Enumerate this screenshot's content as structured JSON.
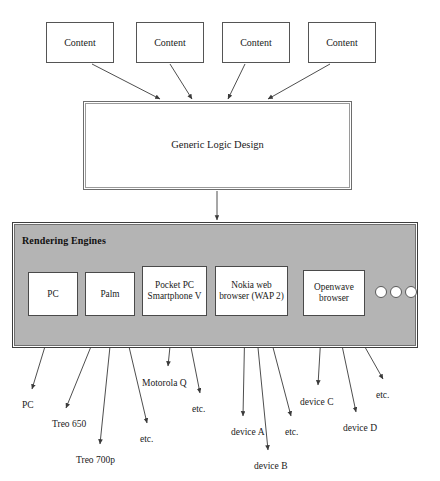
{
  "diagram": {
    "content_boxes": [
      {
        "label": "Content",
        "x": 46,
        "y": 22,
        "w": 68,
        "h": 41
      },
      {
        "label": "Content",
        "x": 136,
        "y": 22,
        "w": 68,
        "h": 41
      },
      {
        "label": "Content",
        "x": 222,
        "y": 22,
        "w": 68,
        "h": 41
      },
      {
        "label": "Content",
        "x": 308,
        "y": 22,
        "w": 68,
        "h": 41
      }
    ],
    "logic_box": {
      "label": "Generic Logic Design",
      "x": 83,
      "y": 101,
      "w": 269,
      "h": 89
    },
    "engines_panel": {
      "title": "Rendering Engines",
      "title_x": 22,
      "title_y": 235,
      "x": 12,
      "y": 222,
      "w": 406,
      "h": 126,
      "fill": "#b4b4b4"
    },
    "engine_boxes": [
      {
        "label": "PC",
        "x": 28,
        "y": 272,
        "w": 50,
        "h": 44
      },
      {
        "label": "Palm",
        "x": 85,
        "y": 272,
        "w": 50,
        "h": 44
      },
      {
        "label": "Pocket PC Smartphone V",
        "x": 142,
        "y": 266,
        "w": 65,
        "h": 50
      },
      {
        "label": "Nokia web browser (WAP 2)",
        "x": 215,
        "y": 266,
        "w": 73,
        "h": 50
      },
      {
        "label": "Openwave browser",
        "x": 303,
        "y": 270,
        "w": 62,
        "h": 46
      }
    ],
    "dots": [
      {
        "cx": 381,
        "cy": 292,
        "r": 6
      },
      {
        "cx": 396,
        "cy": 292,
        "r": 6
      },
      {
        "cx": 411,
        "cy": 292,
        "r": 6
      }
    ],
    "leaf_labels": [
      {
        "label": "PC",
        "x": 22,
        "y": 400
      },
      {
        "label": "Treo 650",
        "x": 52,
        "y": 419
      },
      {
        "label": "Treo 700p",
        "x": 76,
        "y": 455
      },
      {
        "label": "etc.",
        "x": 140,
        "y": 434
      },
      {
        "label": "Motorola Q",
        "x": 142,
        "y": 378
      },
      {
        "label": "etc.",
        "x": 192,
        "y": 404
      },
      {
        "label": "device A",
        "x": 231,
        "y": 427
      },
      {
        "label": "device B",
        "x": 254,
        "y": 461
      },
      {
        "label": "etc.",
        "x": 285,
        "y": 427
      },
      {
        "label": "device C",
        "x": 300,
        "y": 397
      },
      {
        "label": "device D",
        "x": 343,
        "y": 423
      },
      {
        "label": "etc.",
        "x": 376,
        "y": 390
      }
    ],
    "arrows": {
      "content_to_logic": [
        {
          "x1": 92,
          "y1": 64,
          "x2": 160,
          "y2": 99
        },
        {
          "x1": 170,
          "y1": 64,
          "x2": 192,
          "y2": 99
        },
        {
          "x1": 245,
          "y1": 64,
          "x2": 228,
          "y2": 99
        },
        {
          "x1": 330,
          "y1": 64,
          "x2": 268,
          "y2": 99
        }
      ],
      "logic_to_engines": [
        {
          "x1": 217,
          "y1": 191,
          "x2": 217,
          "y2": 220
        }
      ],
      "engines_to_leaves": [
        {
          "x1": 54,
          "y1": 317,
          "x2": 32,
          "y2": 389
        },
        {
          "x1": 103,
          "y1": 317,
          "x2": 66,
          "y2": 408
        },
        {
          "x1": 113,
          "y1": 317,
          "x2": 100,
          "y2": 444
        },
        {
          "x1": 122,
          "y1": 317,
          "x2": 147,
          "y2": 423
        },
        {
          "x1": 173,
          "y1": 317,
          "x2": 168,
          "y2": 366
        },
        {
          "x1": 185,
          "y1": 317,
          "x2": 200,
          "y2": 393
        },
        {
          "x1": 245,
          "y1": 317,
          "x2": 243,
          "y2": 416
        },
        {
          "x1": 255,
          "y1": 317,
          "x2": 268,
          "y2": 450
        },
        {
          "x1": 265,
          "y1": 317,
          "x2": 291,
          "y2": 416
        },
        {
          "x1": 322,
          "y1": 317,
          "x2": 318,
          "y2": 385
        },
        {
          "x1": 336,
          "y1": 317,
          "x2": 356,
          "y2": 412
        },
        {
          "x1": 348,
          "y1": 317,
          "x2": 383,
          "y2": 379
        }
      ]
    },
    "colors": {
      "panel_fill": "#b4b4b4",
      "box_fill": "#ffffff",
      "stroke": "#555555",
      "text": "#1a1a1a"
    }
  }
}
